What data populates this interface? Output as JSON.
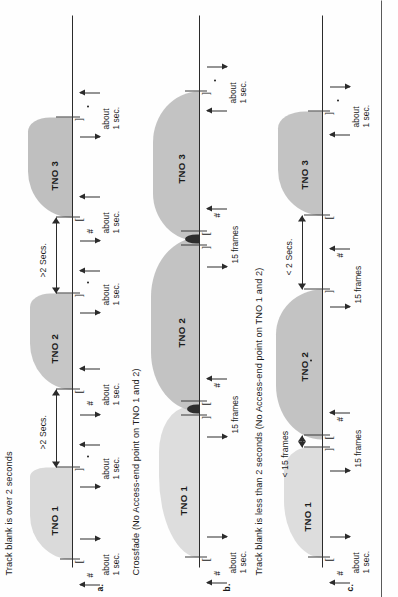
{
  "page": {
    "orientation_deg": -90,
    "background": "#ffffff",
    "ink": "#1b1b1b",
    "waveform_fill": "#bcbcbc",
    "crossfade_fill": "#2d2d2d"
  },
  "panels": [
    {
      "letter": "a.",
      "caption": "Track blank is over 2 seconds",
      "tracks": [
        "TNO 1",
        "TNO 2",
        "TNO 3"
      ],
      "gap_labels": [
        ">2 Secs.",
        ">2 Secs."
      ],
      "interval_labels": [
        "about 1 sec.",
        "about 1 sec.",
        "about 1 sec.",
        "about 1 sec.",
        "about 1 sec.",
        "about 1 sec."
      ],
      "markers": [
        "#",
        ".",
        "#",
        ".",
        "#",
        "."
      ]
    },
    {
      "letter": "b.",
      "caption": "Crossfade (No Access-end point on TNO 1 and 2)",
      "tracks": [
        "TNO 1",
        "TNO 2",
        "TNO 3"
      ],
      "gap_labels": [
        "15 frames",
        "15 frames"
      ],
      "interval_labels": [
        "about 1 sec.",
        "about 1 sec."
      ],
      "markers": [
        "#",
        "#",
        "#",
        "."
      ]
    },
    {
      "letter": "c.",
      "caption": "Track blank is less than 2 seconds (No Access-end point on TNO 1 and 2)",
      "tracks": [
        "TNO 1",
        "TNO 2",
        "TNO 3"
      ],
      "gap_labels": [
        "< 15 frames",
        "< 2 Secs."
      ],
      "interval_labels": [
        "about 1 sec.",
        "15 frames",
        "15 frames",
        "about 1 sec."
      ],
      "markers": [
        "#",
        ".",
        "#",
        "."
      ]
    }
  ],
  "glyphs": {
    "bracket_open": "[",
    "bracket_close": "]",
    "hash": "#",
    "dot": "."
  }
}
